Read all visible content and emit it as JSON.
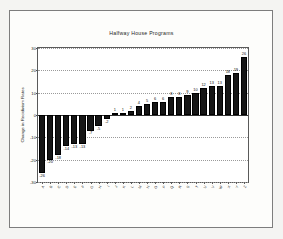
{
  "chart_data": {
    "type": "bar",
    "title": "Halfway House Programs",
    "xlabel": "",
    "ylabel": "Change in Recidivism Rates",
    "ylim": [
      -30,
      30
    ],
    "yticks": [
      -30,
      -20,
      -10,
      0,
      10,
      20,
      30
    ],
    "ytick_labels": [
      "-30",
      "-20",
      "-10",
      "0",
      "10",
      "20",
      "30"
    ],
    "grid": true,
    "legend": "none",
    "bar_color": "#161616",
    "categories": [
      "A",
      "B",
      "C",
      "D",
      "E",
      "F",
      "G",
      "H",
      "I",
      "J",
      "K",
      "L",
      "M",
      "N",
      "O",
      "P",
      "Q",
      "R",
      "S",
      "T",
      "U",
      "V",
      "W",
      "X",
      "Y",
      "Z",
      "AA",
      "AB",
      "AC",
      "AD"
    ],
    "values": [
      -26,
      -20,
      -18,
      -14,
      -13,
      -7,
      -5,
      -2,
      0,
      1,
      1,
      2,
      4,
      5,
      6,
      6,
      8,
      8,
      8,
      9,
      10,
      12,
      13,
      13,
      18,
      19,
      26,
      8,
      6,
      1
    ],
    "bars": [
      {
        "label": "A",
        "value": -26,
        "data_label": "-26"
      },
      {
        "label": "B",
        "value": -20,
        "data_label": "-20"
      },
      {
        "label": "C",
        "value": -18,
        "data_label": "-18"
      },
      {
        "label": "D",
        "value": -14,
        "data_label": "-14"
      },
      {
        "label": "E",
        "value": -13,
        "data_label": "-13"
      },
      {
        "label": "F",
        "value": -13,
        "data_label": "-13"
      },
      {
        "label": "G",
        "value": -7,
        "data_label": "-7"
      },
      {
        "label": "H",
        "value": -5,
        "data_label": "-5"
      },
      {
        "label": "I",
        "value": -2,
        "data_label": "-2"
      },
      {
        "label": "J",
        "value": 1,
        "data_label": "1"
      },
      {
        "label": "K",
        "value": 1,
        "data_label": "1"
      },
      {
        "label": "L",
        "value": 2,
        "data_label": "2"
      },
      {
        "label": "M",
        "value": 4,
        "data_label": "4"
      },
      {
        "label": "N",
        "value": 5,
        "data_label": "5"
      },
      {
        "label": "O",
        "value": 6,
        "data_label": "6"
      },
      {
        "label": "P",
        "value": 6,
        "data_label": "6"
      },
      {
        "label": "Q",
        "value": 8,
        "data_label": "8"
      },
      {
        "label": "R",
        "value": 8,
        "data_label": "8"
      },
      {
        "label": "S",
        "value": 9,
        "data_label": "9"
      },
      {
        "label": "T",
        "value": 10,
        "data_label": "10"
      },
      {
        "label": "U",
        "value": 12,
        "data_label": "12"
      },
      {
        "label": "V",
        "value": 13,
        "data_label": "13"
      },
      {
        "label": "W",
        "value": 13,
        "data_label": "13"
      },
      {
        "label": "X",
        "value": 18,
        "data_label": "18"
      },
      {
        "label": "Y",
        "value": 19,
        "data_label": "19"
      },
      {
        "label": "Z",
        "value": 26,
        "data_label": "26"
      }
    ]
  }
}
